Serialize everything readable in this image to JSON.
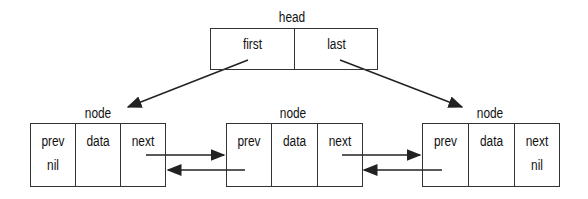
{
  "head": {
    "label": "head",
    "fields": [
      "first",
      "last"
    ]
  },
  "nodes": [
    {
      "label": "node",
      "fields": [
        "prev",
        "data",
        "next"
      ],
      "prev_value": "nil",
      "next_value": ""
    },
    {
      "label": "node",
      "fields": [
        "prev",
        "data",
        "next"
      ],
      "prev_value": "",
      "next_value": ""
    },
    {
      "label": "node",
      "fields": [
        "prev",
        "data",
        "next"
      ],
      "prev_value": "",
      "next_value": "nil"
    }
  ],
  "colors": {
    "line": "#333333",
    "text": "#111111",
    "background": "#ffffff"
  }
}
